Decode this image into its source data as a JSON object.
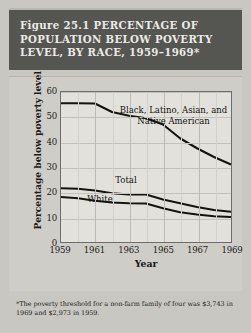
{
  "figure": {
    "title": "Figure 25.1  PERCENTAGE OF\nPOPULATION BELOW POVERTY\nLEVEL, BY RACE, 1959–1969*",
    "footnote": "*The poverty threshold for a non-farm family of four was $3,743 in 1969 and $2,973 in 1959.",
    "banner_color": "#555552",
    "banner_text_color": "#eceae5",
    "plot_background": "#e3e1dc",
    "page_background": "#c9c7c2",
    "line_color": "#15150f"
  },
  "chart_data": {
    "type": "line",
    "title": "Figure 25.1  PERCENTAGE OF POPULATION BELOW POVERTY LEVEL, BY RACE, 1959–1969*",
    "xlabel": "Year",
    "ylabel": "Percentage below poverty level",
    "x": [
      1959,
      1960,
      1961,
      1962,
      1963,
      1964,
      1965,
      1966,
      1967,
      1968,
      1969
    ],
    "xlim": [
      1959,
      1969
    ],
    "ylim": [
      0,
      60
    ],
    "xticks": [
      1959,
      1961,
      1963,
      1965,
      1967,
      1969
    ],
    "xtick_labels": [
      "1959",
      "1961",
      "1963",
      "1965",
      "1967",
      "1969"
    ],
    "yticks": [
      0,
      10,
      20,
      30,
      40,
      50,
      60
    ],
    "ytick_labels": [
      "0",
      "10",
      "20",
      "30",
      "40",
      "50",
      "60"
    ],
    "grid": true,
    "legend": "in-plot annotations",
    "series": [
      {
        "name": "Black, Latino, Asian, and Native American",
        "values": [
          55.5,
          55.5,
          55.4,
          52.0,
          50.5,
          49.5,
          47.0,
          41.5,
          37.5,
          34.0,
          31.0
        ],
        "annotation": "Black, Latino, Asian, and\nNative American"
      },
      {
        "name": "Total",
        "values": [
          21.5,
          21.3,
          20.6,
          19.5,
          19.0,
          19.0,
          17.0,
          15.5,
          14.0,
          12.8,
          12.1
        ],
        "annotation": "Total"
      },
      {
        "name": "White",
        "values": [
          18.0,
          17.5,
          16.5,
          15.8,
          15.5,
          15.4,
          13.5,
          11.9,
          11.0,
          10.3,
          10.0
        ],
        "annotation": "White"
      }
    ]
  }
}
